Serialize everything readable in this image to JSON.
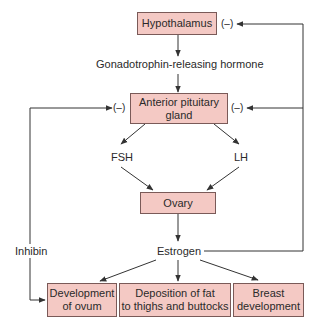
{
  "diagram": {
    "type": "flowchart",
    "colors": {
      "box_fill": "#f4c9c4",
      "box_border": "#7a5a58",
      "line": "#333333"
    },
    "nodes": {
      "hypothalamus": "Hypothalamus",
      "anterior_pituitary_line1": "Anterior pituitary",
      "anterior_pituitary_line2": "gland",
      "ovary": "Ovary",
      "development_of_ovum_line1": "Development",
      "development_of_ovum_line2": "of ovum",
      "fat_deposition_line1": "Deposition of fat",
      "fat_deposition_line2": "to thighs and buttocks",
      "breast_development_line1": "Breast",
      "breast_development_line2": "development"
    },
    "labels": {
      "gnrh": "Gonadotrophin-releasing hormone",
      "fsh": "FSH",
      "lh": "LH",
      "estrogen": "Estrogen",
      "inhibin": "Inhibin",
      "negative": "(–)"
    },
    "edges": [
      {
        "from": "Hypothalamus",
        "to": "Gonadotrophin-releasing hormone"
      },
      {
        "from": "Gonadotrophin-releasing hormone",
        "to": "Anterior pituitary gland"
      },
      {
        "from": "Anterior pituitary gland",
        "to": "FSH"
      },
      {
        "from": "Anterior pituitary gland",
        "to": "LH"
      },
      {
        "from": "FSH",
        "to": "Ovary"
      },
      {
        "from": "LH",
        "to": "Ovary"
      },
      {
        "from": "Ovary",
        "to": "Estrogen"
      },
      {
        "from": "Estrogen",
        "to": "Development of ovum"
      },
      {
        "from": "Estrogen",
        "to": "Deposition of fat to thighs and buttocks"
      },
      {
        "from": "Estrogen",
        "to": "Breast development"
      },
      {
        "from": "Estrogen",
        "to": "Hypothalamus",
        "sign": "(–)"
      },
      {
        "from": "Estrogen",
        "to": "Anterior pituitary gland",
        "sign": "(–)"
      },
      {
        "from": "Inhibin",
        "to": "Anterior pituitary gland",
        "sign": "(–)"
      },
      {
        "from": "Inhibin",
        "to": "Development of ovum"
      }
    ]
  }
}
